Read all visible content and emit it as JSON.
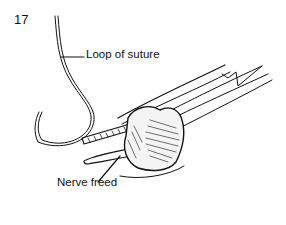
{
  "figure": {
    "number": "17",
    "labels": {
      "loop_of_suture": "Loop of suture",
      "nerve_freed": "Nerve freed"
    }
  }
}
